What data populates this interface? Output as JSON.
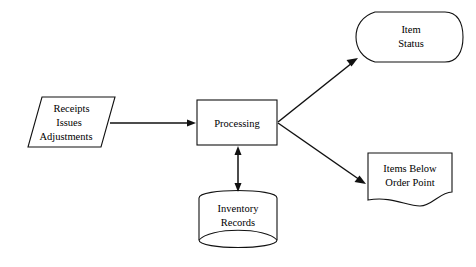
{
  "diagram": {
    "background_color": "#ffffff",
    "line_color": "#111111",
    "text_color": "#000000",
    "nodes": {
      "input_source": {
        "shape": "parallelogram",
        "shape_meaning": "manual-input-or-data",
        "line1": "Receipts",
        "line2": "Issues",
        "line3": "Adjustments"
      },
      "process": {
        "shape": "rectangle",
        "shape_meaning": "process",
        "label": "Processing"
      },
      "storage": {
        "shape": "direct-access-storage",
        "shape_meaning": "direct-access-storage-device",
        "line1": "Inventory",
        "line2": "Records"
      },
      "display_output": {
        "shape": "display",
        "shape_meaning": "display-screen-output",
        "line1": "Item",
        "line2": "Status"
      },
      "document_output": {
        "shape": "document",
        "shape_meaning": "printed-document-output",
        "line1": "Items Below",
        "line2": "Order Point"
      }
    },
    "connectors": {
      "input_to_process": {
        "from": "input_source",
        "to": "process",
        "direction": "one-way"
      },
      "process_to_storage": {
        "from": "process",
        "to": "storage",
        "direction": "two-way"
      },
      "process_to_display": {
        "from": "process",
        "to": "display_output",
        "direction": "one-way"
      },
      "process_to_document": {
        "from": "process",
        "to": "document_output",
        "direction": "one-way"
      }
    }
  }
}
